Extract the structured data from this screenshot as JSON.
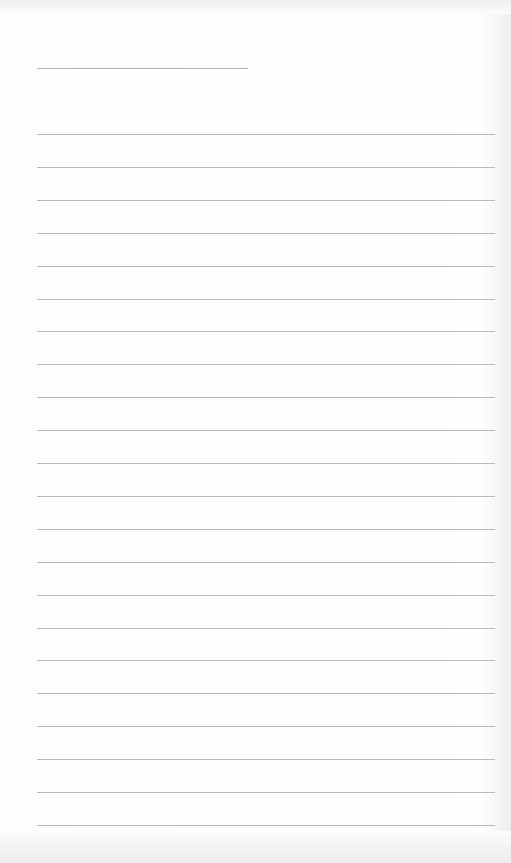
{
  "page": {
    "type": "lined-notebook-page",
    "background_color": "#fdfdfd",
    "line_color": "#b9b9b9",
    "title_line": {
      "x1": 37,
      "x2": 248,
      "y": 68
    },
    "ruled_lines": {
      "x1": 37,
      "x2": 495,
      "first_y": 134,
      "spacing": 32.9,
      "count": 22
    }
  }
}
